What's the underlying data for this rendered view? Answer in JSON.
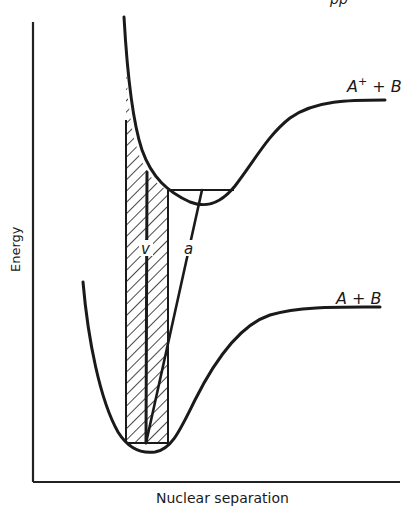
{
  "figure": {
    "x_axis_label": "Nuclear separation",
    "y_axis_label": "Energy",
    "upper_curve_label": {
      "base": "A",
      "sup": "+",
      "rest": " + B"
    },
    "lower_curve_label": "A + B",
    "vertical_transition_label": "v",
    "adiabatic_transition_label": "a",
    "top_cut_text": "pp"
  },
  "colors": {
    "ink": "#1a1a1a",
    "background": "#ffffff"
  }
}
